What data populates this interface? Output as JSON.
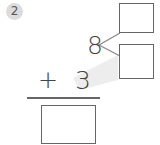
{
  "problem": {
    "number": "2",
    "top_number": "8",
    "operator": "+",
    "addend": "3",
    "decompose_boxes": [
      "",
      ""
    ],
    "answer_box": ""
  },
  "colors": {
    "badge_bg": "#dcdcdc",
    "ink": "#444444",
    "box_border": "#666666",
    "shade": "#ececec"
  }
}
